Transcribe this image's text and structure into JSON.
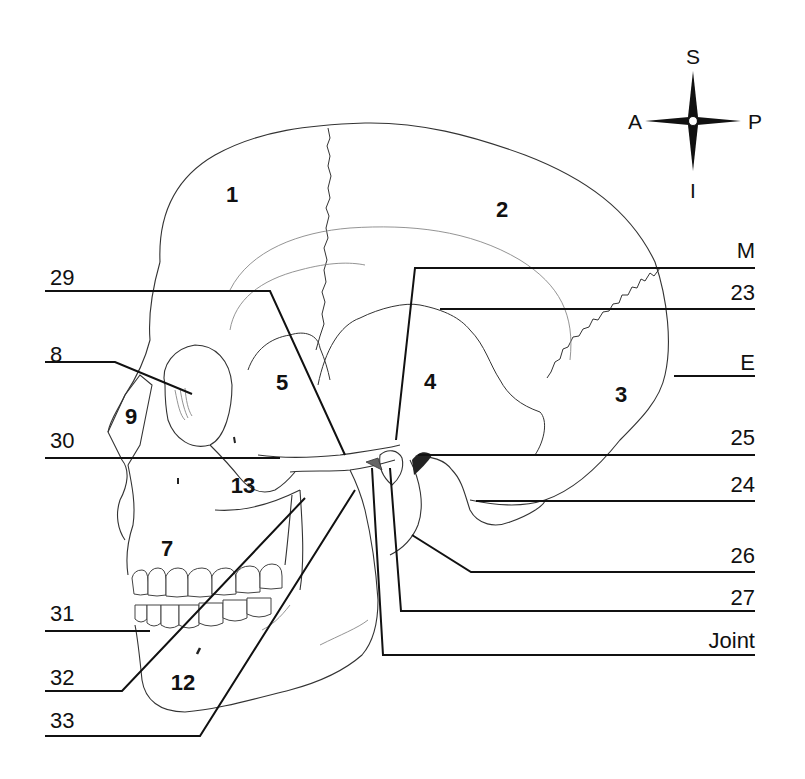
{
  "compass": {
    "superior": "S",
    "inferior": "I",
    "anterior": "A",
    "posterior": "P",
    "center": [
      693,
      121
    ]
  },
  "bone_numbers": [
    {
      "id": "1",
      "text": "1",
      "x": 232,
      "y": 202
    },
    {
      "id": "2",
      "text": "2",
      "x": 502,
      "y": 217
    },
    {
      "id": "3",
      "text": "3",
      "x": 621,
      "y": 402
    },
    {
      "id": "4",
      "text": "4",
      "x": 430,
      "y": 389
    },
    {
      "id": "5",
      "text": "5",
      "x": 282,
      "y": 390
    },
    {
      "id": "7",
      "text": "7",
      "x": 167,
      "y": 556
    },
    {
      "id": "9",
      "text": "9",
      "x": 131,
      "y": 424
    },
    {
      "id": "12",
      "text": "12",
      "x": 183,
      "y": 690
    },
    {
      "id": "13",
      "text": "13",
      "x": 243,
      "y": 493
    }
  ],
  "external_labels": [
    {
      "id": "29",
      "text": "29",
      "x": 50,
      "y": 285,
      "anchor": "start",
      "path": "M45,291 L270,291 L345,455"
    },
    {
      "id": "8",
      "text": "8",
      "x": 50,
      "y": 362,
      "anchor": "start",
      "path": "M45,362 L115,362 L192,394"
    },
    {
      "id": "30",
      "text": "30",
      "x": 50,
      "y": 448,
      "anchor": "start",
      "path": "M45,458 L280,458"
    },
    {
      "id": "31",
      "text": "31",
      "x": 50,
      "y": 621,
      "anchor": "start",
      "path": "M45,631 L150,631"
    },
    {
      "id": "32",
      "text": "32",
      "x": 50,
      "y": 685,
      "anchor": "start",
      "path": "M45,691 L122,691 L305,498"
    },
    {
      "id": "33",
      "text": "33",
      "x": 50,
      "y": 728,
      "anchor": "start",
      "path": "M45,736 L200,736 L355,490"
    },
    {
      "id": "M",
      "text": "M",
      "x": 755,
      "y": 258,
      "anchor": "end",
      "path": "M755,268 L415,268 L396,440"
    },
    {
      "id": "23",
      "text": "23",
      "x": 755,
      "y": 300,
      "anchor": "end",
      "path": "M755,309 L440,309"
    },
    {
      "id": "E",
      "text": "E",
      "x": 755,
      "y": 370,
      "anchor": "end",
      "path": "M755,376 L674,376"
    },
    {
      "id": "25",
      "text": "25",
      "x": 755,
      "y": 445,
      "anchor": "end",
      "path": "M755,455 L418,455"
    },
    {
      "id": "24",
      "text": "24",
      "x": 755,
      "y": 492,
      "anchor": "end",
      "path": "M755,501 L476,501"
    },
    {
      "id": "26",
      "text": "26",
      "x": 755,
      "y": 563,
      "anchor": "end",
      "path": "M755,572 L471,572 L412,535"
    },
    {
      "id": "27",
      "text": "27",
      "x": 755,
      "y": 605,
      "anchor": "end",
      "path": "M755,611 L401,611 L390,468"
    },
    {
      "id": "Joint",
      "text": "Joint",
      "x": 755,
      "y": 648,
      "anchor": "end",
      "path": "M755,655 L383,655 L372,468"
    }
  ]
}
